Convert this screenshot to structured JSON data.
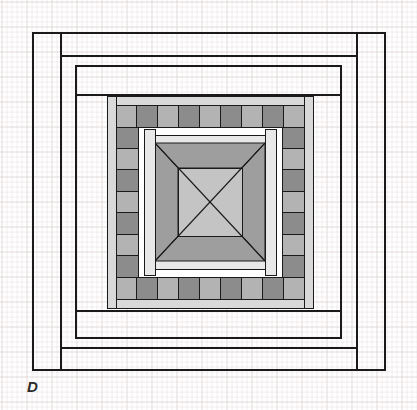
{
  "figure": {
    "label": "D",
    "label_style": "italic",
    "medium": "graph-paper-line-drawing",
    "canvas": {
      "width": 417,
      "height": 410
    }
  },
  "grid": {
    "minor_spacing": 5,
    "major_spacing": 25,
    "minor_color": "#e9e2e2",
    "major_color": "#ddd2d2",
    "origin_x": 2,
    "origin_y": 2
  },
  "palette": {
    "paper": "#ffffff",
    "ink": "#1a1a1a",
    "ink_medium": "#333333",
    "block_light": "#b3b3b3",
    "block_dark": "#8c8c8c",
    "ring_fill": "#a8a8a8",
    "band_light": "#d9d9d9",
    "band_pale": "#e8e8e8",
    "triangle_fill": "#9e9e9e",
    "center_fill": "#c4c4c4",
    "white": "#ffffff"
  },
  "chart_data": {
    "type": "diagram",
    "title": "D",
    "shapes": [
      {
        "name": "outer-frame",
        "kind": "rect-outline",
        "x": 33,
        "y": 33,
        "w": 352,
        "h": 337,
        "stroke": "#1a1a1a",
        "stroke_width": 1.4,
        "fill": "none"
      },
      {
        "name": "outer-inner-frame",
        "kind": "rect-outline",
        "x": 61,
        "y": 33,
        "w": 296,
        "h": 337,
        "stroke": "#1a1a1a",
        "stroke_width": 1.4,
        "fill": "none"
      },
      {
        "name": "second-frame",
        "kind": "rect-outline",
        "x": 61,
        "y": 56,
        "w": 296,
        "h": 292,
        "stroke": "#1a1a1a",
        "stroke_width": 1.4,
        "fill": "none"
      },
      {
        "name": "third-frame",
        "kind": "rect-outline",
        "x": 76,
        "y": 66,
        "w": 265,
        "h": 272,
        "stroke": "#1a1a1a",
        "stroke_width": 1.4,
        "fill": "none"
      },
      {
        "name": "fourth-frame",
        "kind": "rect-outline",
        "x": 76,
        "y": 95,
        "w": 265,
        "h": 216,
        "stroke": "#1a1a1a",
        "stroke_width": 1.4,
        "fill": "none"
      },
      {
        "name": "block-ring-outer",
        "kind": "rect-filled",
        "x": 107,
        "y": 96,
        "w": 206,
        "h": 212,
        "fill": "#a8a8a8",
        "stroke": "#1a1a1a",
        "stroke_width": 1.2
      },
      {
        "name": "block-ring-inner-void",
        "kind": "rect-filled",
        "x": 130,
        "y": 119,
        "w": 160,
        "h": 166,
        "fill": "#ffffff",
        "stroke": "#1a1a1a",
        "stroke_width": 1.0
      },
      {
        "name": "center-band",
        "kind": "rect-filled",
        "x": 147,
        "y": 135,
        "w": 126,
        "h": 134,
        "fill": "#e8e8e8",
        "stroke": "#1a1a1a",
        "stroke_width": 1.0
      },
      {
        "name": "center-square-outer",
        "kind": "rect-filled",
        "x": 155,
        "y": 143,
        "w": 110,
        "h": 118,
        "fill": "#9e9e9e",
        "stroke": "#1a1a1a",
        "stroke_width": 1.0
      },
      {
        "name": "center-square-inner",
        "kind": "rect-filled",
        "x": 178,
        "y": 168,
        "w": 64,
        "h": 68,
        "fill": "#c4c4c4",
        "stroke": "#1a1a1a",
        "stroke_width": 1.0
      },
      {
        "name": "center-diagonals",
        "kind": "cross-lines",
        "stroke": "#1a1a1a",
        "stroke_width": 1.0
      }
    ],
    "block_ring": {
      "top_blocks": 9,
      "bottom_blocks": 9,
      "left_blocks": 7,
      "right_blocks": 7,
      "alternation": [
        "light",
        "dark"
      ],
      "light_fill": "#b3b3b3",
      "dark_fill": "#8c8c8c",
      "stroke": "#1a1a1a"
    }
  }
}
